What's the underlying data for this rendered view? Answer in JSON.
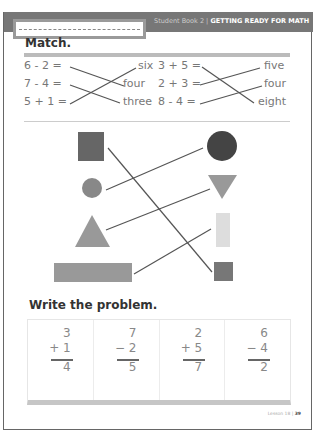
{
  "header": {
    "book": "Student Book 2",
    "separator": " | ",
    "title": "GETTING READY FOR MATH",
    "name_field_placeholder": ""
  },
  "match_section": {
    "heading": "Match.",
    "left_column": {
      "equations": [
        "6 - 2 =",
        "7 - 4 =",
        "5 + 1 ="
      ],
      "answers": [
        "six",
        "four",
        "three"
      ],
      "connections": [
        [
          0,
          1
        ],
        [
          1,
          2
        ],
        [
          2,
          0
        ]
      ]
    },
    "right_column": {
      "equations": [
        "3 + 5 =",
        "2 + 3 =",
        "8 - 4 ="
      ],
      "answers": [
        "five",
        "four",
        "eight"
      ],
      "connections": [
        [
          0,
          2
        ],
        [
          1,
          0
        ],
        [
          2,
          1
        ]
      ]
    }
  },
  "shapes_section": {
    "left_shapes": [
      "dark square",
      "small circle",
      "triangle",
      "long rectangle"
    ],
    "right_shapes": [
      "dark circle",
      "inverted triangle",
      "tall narrow rectangle",
      "small square"
    ],
    "connections": [
      [
        0,
        3
      ],
      [
        1,
        0
      ],
      [
        2,
        1
      ],
      [
        3,
        2
      ]
    ]
  },
  "write_section": {
    "heading": "Write the problem.",
    "problems": [
      {
        "top": "3",
        "operator": "+",
        "bottom": "1",
        "result": "4"
      },
      {
        "top": "7",
        "operator": "−",
        "bottom": "2",
        "result": "5"
      },
      {
        "top": "2",
        "operator": "+",
        "bottom": "5",
        "result": "7"
      },
      {
        "top": "6",
        "operator": "−",
        "bottom": "4",
        "result": "2"
      }
    ]
  },
  "footer": {
    "lesson": "Lesson 18",
    "separator": " | ",
    "page": "39"
  }
}
